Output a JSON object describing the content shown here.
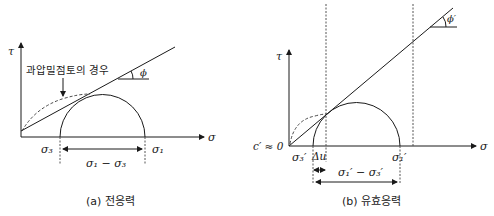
{
  "panel_a": {
    "caption": "(a) 전응력",
    "tau_label": "τ",
    "sigma_label": "σ",
    "annotation": "과압밀점토의 경우",
    "phi_label": "ϕ",
    "sigma3": "σ₃",
    "sigma1": "σ₁",
    "deviator": "σ₁ − σ₃"
  },
  "panel_b": {
    "caption": "(b) 유효응력",
    "tau_label": "τ",
    "sigma_label": "σ",
    "c_label": "c′ ≈ 0",
    "phi_label": "ϕ′",
    "sigma3": "σ₃′",
    "delta_u": "Δu",
    "sigma1": "σ₁′",
    "deviator": "σ₁′ − σ₃′"
  }
}
